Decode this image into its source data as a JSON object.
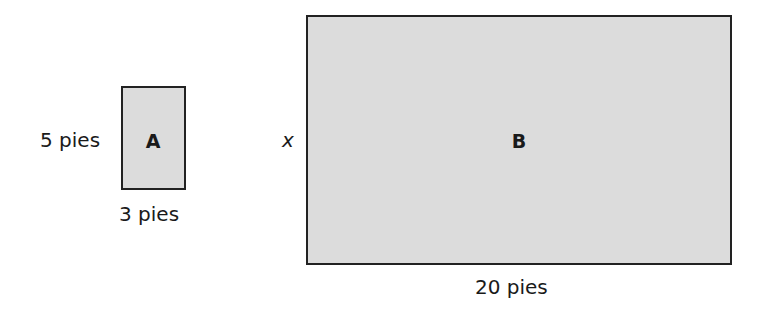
{
  "figure": {
    "rect_a": {
      "label": "A",
      "height_label": "5 pies",
      "width_label": "3 pies",
      "fill": "#dcdcdc",
      "stroke": "#222222"
    },
    "rect_b": {
      "label": "B",
      "height_label": "x",
      "width_label": "20 pies",
      "fill": "#dcdcdc",
      "stroke": "#222222"
    }
  }
}
